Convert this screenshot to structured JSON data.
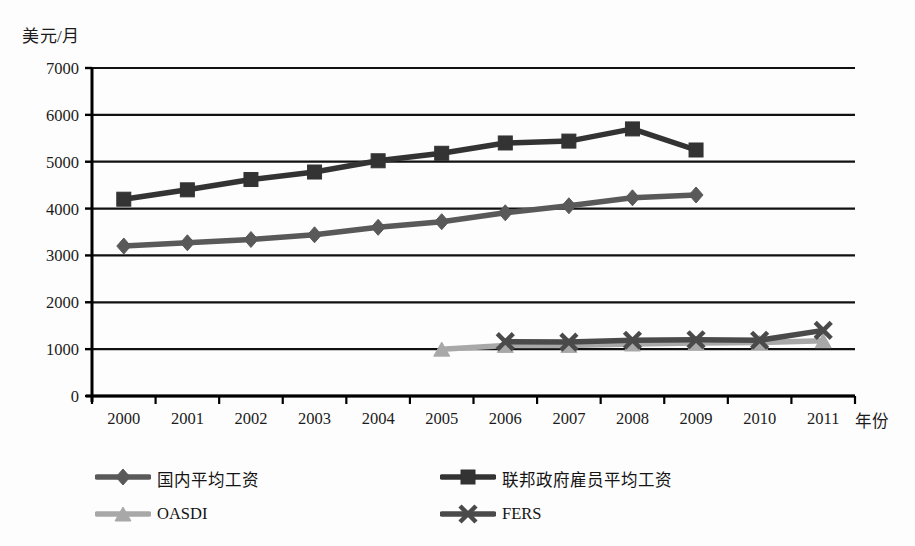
{
  "chart_data": {
    "type": "line",
    "title": "",
    "subtitle": "",
    "ylabel": "美元/月",
    "xlabel": "年份",
    "x": [
      2000,
      2001,
      2002,
      2003,
      2004,
      2005,
      2006,
      2007,
      2008,
      2009,
      2010,
      2011
    ],
    "categories": [
      "2000",
      "2001",
      "2002",
      "2003",
      "2004",
      "2005",
      "2006",
      "2007",
      "2008",
      "2009",
      "2010",
      "2011"
    ],
    "ylim": [
      0,
      7000
    ],
    "yticks": [
      0,
      1000,
      2000,
      3000,
      4000,
      5000,
      6000,
      7000
    ],
    "yticklabels": [
      "0",
      "1000",
      "2000",
      "3000",
      "4000",
      "5000",
      "6000",
      "7000"
    ],
    "grid": true,
    "grid_axis": "y",
    "legend_position": "below-plot",
    "legend_columns": 2,
    "series": [
      {
        "name": "国内平均工资",
        "marker": "diamond",
        "color": "#595959",
        "values": [
          3200,
          3270,
          3340,
          3440,
          3600,
          3720,
          3910,
          4060,
          4230,
          4290,
          null,
          null
        ]
      },
      {
        "name": "联邦政府雇员平均工资",
        "marker": "square",
        "color": "#333333",
        "values": [
          4200,
          4400,
          4620,
          4780,
          5020,
          5180,
          5400,
          5440,
          5700,
          5250,
          null,
          null
        ]
      },
      {
        "name": "OASDI",
        "marker": "triangle",
        "color": "#a8a8a8",
        "values": [
          null,
          null,
          null,
          null,
          null,
          1000,
          1080,
          1080,
          1110,
          1130,
          1140,
          1180
        ]
      },
      {
        "name": "FERS",
        "marker": "cross",
        "color": "#4a4a4a",
        "values": [
          null,
          null,
          null,
          null,
          null,
          null,
          1160,
          1150,
          1190,
          1200,
          1190,
          1400
        ]
      }
    ]
  },
  "axes": {
    "y_axis_title": "美元/月",
    "x_axis_title": "年份"
  },
  "legend": {
    "entries": [
      {
        "label": "国内平均工资",
        "marker": "diamond",
        "color": "#595959"
      },
      {
        "label": "联邦政府雇员平均工资",
        "marker": "square",
        "color": "#333333"
      },
      {
        "label": "OASDI",
        "marker": "triangle",
        "color": "#a8a8a8"
      },
      {
        "label": "FERS",
        "marker": "cross",
        "color": "#4a4a4a"
      }
    ]
  },
  "colors": {
    "background": "#fdfdfd",
    "axis": "#000000",
    "grid": "#111111",
    "domestic_salary": "#595959",
    "federal_salary": "#333333",
    "oasdi": "#a8a8a8",
    "fers": "#4a4a4a"
  }
}
